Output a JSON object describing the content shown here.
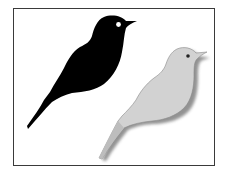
{
  "illustration": {
    "description": "Two bird silhouettes in a framed panel",
    "birds": [
      {
        "name": "black-bird",
        "fill": "#000000",
        "eye": "#ffffff"
      },
      {
        "name": "gray-bird",
        "fill": "#d4d4d4",
        "shadow": "#7a7a7a",
        "eye": "#222222"
      }
    ],
    "frame_color": "#3a3a3a",
    "background": "#ffffff"
  }
}
